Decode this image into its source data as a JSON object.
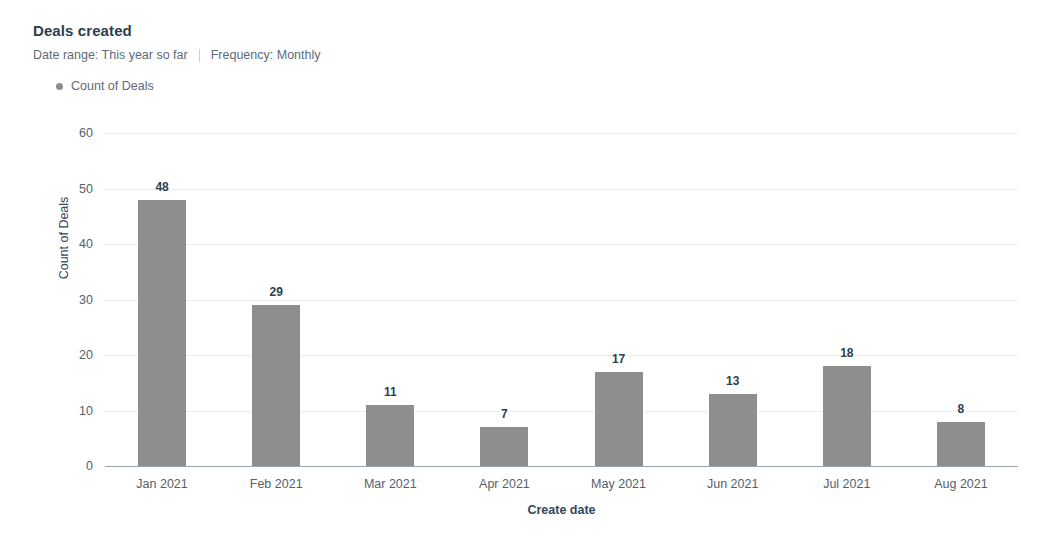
{
  "header": {
    "title": "Deals created",
    "date_range": "Date range: This year so far",
    "frequency": "Frequency: Monthly"
  },
  "legend": {
    "items": [
      {
        "label": "Count of Deals",
        "color": "#8c8c8c"
      }
    ]
  },
  "chart_data": {
    "type": "bar",
    "title": "Deals created",
    "categories": [
      "Jan 2021",
      "Feb 2021",
      "Mar 2021",
      "Apr 2021",
      "May 2021",
      "Jun 2021",
      "Jul 2021",
      "Aug 2021"
    ],
    "values": [
      48,
      29,
      11,
      7,
      17,
      13,
      18,
      8
    ],
    "series": [
      {
        "name": "Count of Deals",
        "values": [
          48,
          29,
          11,
          7,
          17,
          13,
          18,
          8
        ]
      }
    ],
    "xlabel": "Create date",
    "ylabel": "Count of Deals",
    "ylim": [
      0,
      60
    ],
    "yticks": [
      0,
      10,
      20,
      30,
      40,
      50,
      60
    ],
    "grid": true,
    "legend_position": "top-left",
    "bar_color": "#8e8e8e",
    "data_labels": true
  }
}
